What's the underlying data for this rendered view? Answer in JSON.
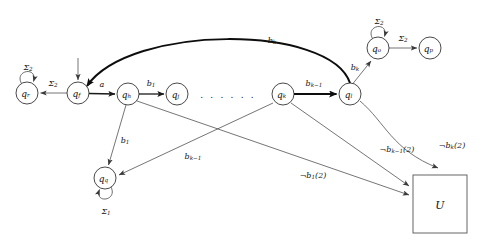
{
  "diagram": {
    "kind": "finite-state-automaton",
    "title": "",
    "ellipsis": ". . . . . .",
    "states": [
      {
        "id": "qr",
        "label": "q",
        "sub": "r",
        "cx": 27,
        "cy": 93,
        "r": 11
      },
      {
        "id": "qf",
        "label": "q",
        "sub": "f",
        "cx": 78,
        "cy": 93,
        "r": 11
      },
      {
        "id": "qh",
        "label": "q",
        "sub": "h",
        "cx": 128,
        "cy": 94,
        "r": 11
      },
      {
        "id": "qj",
        "label": "q",
        "sub": "j",
        "cx": 177,
        "cy": 94,
        "r": 11
      },
      {
        "id": "qk",
        "label": "q",
        "sub": "k",
        "cx": 283,
        "cy": 94,
        "r": 11
      },
      {
        "id": "ql",
        "label": "q",
        "sub": "l",
        "cx": 350,
        "cy": 94,
        "r": 11
      },
      {
        "id": "qo",
        "label": "q",
        "sub": "o",
        "cx": 378,
        "cy": 48,
        "r": 11
      },
      {
        "id": "qp",
        "label": "q",
        "sub": "p",
        "cx": 430,
        "cy": 48,
        "r": 11
      }
    ],
    "box": {
      "id": "U",
      "label": "U",
      "x": 413,
      "y": 175,
      "width": 54,
      "height": 58
    },
    "self_loops": [
      {
        "id": "loop-qr",
        "state": "qr",
        "label": "Σ",
        "sub": "2"
      },
      {
        "id": "loop-qo",
        "state": "qo",
        "label": "Σ",
        "sub": "2"
      },
      {
        "id": "loop-qq",
        "state": "qq",
        "label": "Σ",
        "sub": "1"
      }
    ],
    "edges": [
      {
        "id": "start-arrow",
        "from": "",
        "to": "qf",
        "label": "",
        "sub": ""
      },
      {
        "id": "qf-qr",
        "from": "qf",
        "to": "qr",
        "label": "Σ",
        "sub": "2"
      },
      {
        "id": "qf-qh",
        "from": "qf",
        "to": "qh",
        "label": "a",
        "sub": ""
      },
      {
        "id": "qh-qj",
        "from": "qh",
        "to": "qj",
        "label": "b",
        "sub": "1"
      },
      {
        "id": "qk-ql",
        "from": "qk",
        "to": "ql",
        "label": "b",
        "sub": "k−1"
      },
      {
        "id": "ql-qf-arc",
        "from": "ql",
        "to": "qf",
        "label": "b",
        "sub": "k"
      },
      {
        "id": "ql-qo",
        "from": "ql",
        "to": "qo",
        "label": "b",
        "sub": "k"
      },
      {
        "id": "qo-qp",
        "from": "qo",
        "to": "qp",
        "label": "Σ",
        "sub": "2"
      },
      {
        "id": "qh-qq",
        "from": "qh",
        "to": "qq",
        "label": "b",
        "sub": "1"
      },
      {
        "id": "qk-qq",
        "from": "qk",
        "to": "qq",
        "label": "b",
        "sub": "k−1"
      },
      {
        "id": "qh-U",
        "from": "qh",
        "to": "U",
        "label": "¬b",
        "sub": "1",
        "suffix": "(2)"
      },
      {
        "id": "qk-U",
        "from": "qk",
        "to": "U",
        "label": "¬b",
        "sub": "k−1",
        "suffix": "(2)"
      },
      {
        "id": "ql-U",
        "from": "ql",
        "to": "U",
        "label": "¬b",
        "sub": "k",
        "suffix": "(2)"
      }
    ],
    "extra_state": {
      "id": "qq",
      "label": "q",
      "sub": "q",
      "cx": 105,
      "cy": 178,
      "r": 11
    },
    "labels": {
      "sigma2": "Σ",
      "sigma2_sub": "2",
      "sigma1": "Σ",
      "sigma1_sub": "1",
      "a": "a",
      "b1": "b",
      "b1_sub": "1",
      "bk": "b",
      "bk_sub": "k",
      "bkm1": "b",
      "bkm1_sub": "k−1",
      "not_b1": "¬b",
      "not_b1_sub": "1",
      "not_b1_suffix": "(2)",
      "not_bkm1": "¬b",
      "not_bkm1_sub": "k−1",
      "not_bkm1_suffix": "(2)",
      "not_bk": "¬b",
      "not_bk_sub": "k",
      "not_bk_suffix": "(2)",
      "U": "U",
      "qr": "q",
      "qr_sub": "r",
      "qf": "q",
      "qf_sub": "f",
      "qh": "q",
      "qh_sub": "h",
      "qj": "q",
      "qj_sub": "j",
      "qk": "q",
      "qk_sub": "k",
      "ql": "q",
      "ql_sub": "l",
      "qo": "q",
      "qo_sub": "o",
      "qp": "q",
      "qp_sub": "p",
      "qq": "q",
      "qq_sub": "q"
    }
  },
  "colors": {
    "stroke": "#1a1a1a",
    "thin_stroke": "#3a3a3a",
    "box_stroke": "#555555",
    "background": "#ffffff"
  }
}
